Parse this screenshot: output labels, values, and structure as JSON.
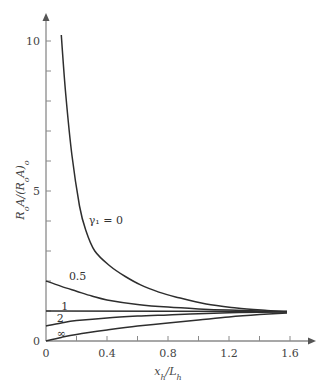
{
  "chart_data": {
    "type": "line",
    "title": "",
    "xlabel": "x_h/L_h",
    "ylabel": "R_oA/(R_oA)_o",
    "xlim": [
      0,
      1.75
    ],
    "ylim": [
      0,
      11
    ],
    "grid": false,
    "legend": "inline curve labels",
    "x_ticks": [
      0,
      0.2,
      0.4,
      0.6,
      0.8,
      1.0,
      1.2,
      1.4,
      1.6
    ],
    "x_tick_labels": [
      "0",
      "",
      "0.4",
      "",
      "0.8",
      "",
      "1.2",
      "",
      "1.6"
    ],
    "y_ticks": [
      0,
      1,
      2,
      3,
      4,
      5,
      6,
      7,
      8,
      9,
      10
    ],
    "y_tick_labels": [
      "0",
      "",
      "",
      "",
      "",
      "5",
      "",
      "",
      "",
      "",
      "10"
    ],
    "series": [
      {
        "name": "γ1 = 0",
        "label": "γ₁ = 0",
        "label_pos": [
          0.28,
          3.9
        ],
        "x": [
          0.1,
          0.13,
          0.17,
          0.22,
          0.26,
          0.32,
          0.42,
          0.52,
          0.62,
          0.74,
          0.85,
          1.05,
          1.25,
          1.45,
          1.58
        ],
        "y": [
          10.2,
          8.2,
          6.2,
          4.5,
          3.7,
          3.0,
          2.5,
          2.15,
          1.87,
          1.63,
          1.47,
          1.23,
          1.1,
          1.02,
          0.98
        ]
      },
      {
        "name": "0.5",
        "label": "0.5",
        "label_pos": [
          0.15,
          2.05
        ],
        "x": [
          0,
          0.1,
          0.2,
          0.3,
          0.4,
          0.6,
          0.8,
          1.0,
          1.2,
          1.4,
          1.58
        ],
        "y": [
          2.0,
          1.82,
          1.66,
          1.5,
          1.37,
          1.22,
          1.13,
          1.07,
          1.03,
          1.0,
          0.98
        ]
      },
      {
        "name": "1",
        "label": "1",
        "label_pos": [
          0.1,
          1.05
        ],
        "x": [
          0,
          1.58
        ],
        "y": [
          1.0,
          0.98
        ]
      },
      {
        "name": "2",
        "label": "2",
        "label_pos": [
          0.07,
          0.62
        ],
        "x": [
          0,
          0.1,
          0.2,
          0.4,
          0.6,
          0.8,
          1.0,
          1.2,
          1.4,
          1.58
        ],
        "y": [
          0.5,
          0.6,
          0.68,
          0.77,
          0.83,
          0.87,
          0.91,
          0.94,
          0.96,
          0.97
        ]
      },
      {
        "name": "∞",
        "label": "∞",
        "label_pos": [
          0.07,
          0.12
        ],
        "x": [
          0,
          0.1,
          0.2,
          0.4,
          0.6,
          0.8,
          1.0,
          1.2,
          1.4,
          1.58
        ],
        "y": [
          0,
          0.12,
          0.22,
          0.37,
          0.5,
          0.6,
          0.7,
          0.8,
          0.88,
          0.93
        ]
      }
    ]
  }
}
